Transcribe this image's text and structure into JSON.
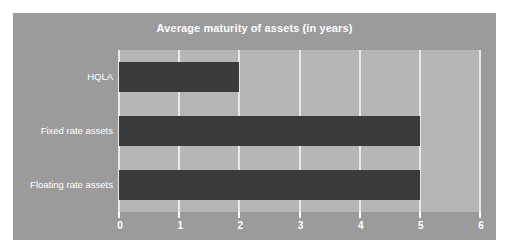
{
  "page": {
    "background_color": "#ffffff"
  },
  "chart_frame": {
    "background_color": "#9b9b9b",
    "plot_background_color": "#b6b6b6"
  },
  "chart_data": {
    "type": "bar",
    "orientation": "horizontal",
    "title": "Average maturity of assets (in years)",
    "xlabel": "",
    "ylabel": "",
    "categories": [
      "HQLA",
      "Fixed rate assets",
      "Floating rate assets"
    ],
    "values": [
      2,
      5,
      5
    ],
    "xlim": [
      0,
      6
    ],
    "xticks": [
      0,
      1,
      2,
      3,
      4,
      5,
      6
    ],
    "xtick_labels": [
      "0",
      "1",
      "2",
      "3",
      "4",
      "5",
      "6"
    ],
    "grid": true,
    "grid_axis": "x",
    "legend": false,
    "legend_position": "none",
    "bar_color": "#3b3b3b",
    "gridline_color": "#e9e9e9",
    "text_color": "#ffffff"
  }
}
